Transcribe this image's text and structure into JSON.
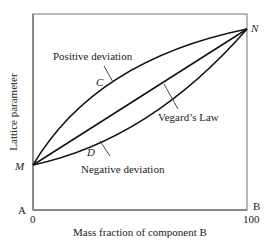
{
  "diagram": {
    "ylabel": "Lattice parameter",
    "xlabel": "Mass fraction of component B",
    "x_ticks": [
      "0",
      "100"
    ],
    "corner_left": "A",
    "corner_right": "B",
    "point_start": "M",
    "point_end": "N",
    "curves": [
      {
        "name": "Positive deviation",
        "marker": "C"
      },
      {
        "name": "Vegard's Law",
        "marker": ""
      },
      {
        "name": "Negative deviation",
        "marker": "D"
      }
    ],
    "labels": {
      "positive": "Positive deviation",
      "vegard": "Vegard’s Law",
      "negative": "Negative deviation",
      "c": "C",
      "d": "D"
    }
  }
}
